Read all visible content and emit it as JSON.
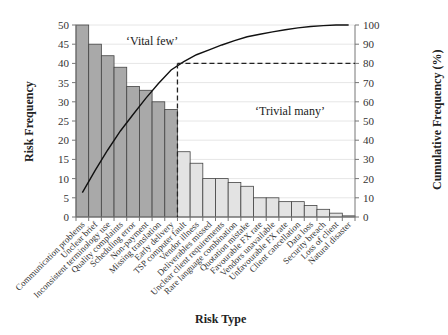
{
  "chart_data": {
    "type": "bar",
    "title": "",
    "xlabel": "Risk Type",
    "ylabel": "Risk Frequency",
    "y2label": "Cumulative Frequency (%)",
    "ylim": [
      0,
      50
    ],
    "y2lim": [
      0,
      100
    ],
    "yticks": [
      0,
      5,
      10,
      15,
      20,
      25,
      30,
      35,
      40,
      45,
      50
    ],
    "y2ticks": [
      0,
      10,
      20,
      30,
      40,
      50,
      60,
      70,
      80,
      90,
      100
    ],
    "grid": true,
    "categories": [
      "Communication problems",
      "Unclear brief",
      "Inconsistent terminology use",
      "Quality complaints",
      "Scheduling error",
      "Non-payment",
      "Missing translation",
      "Early delivery",
      "TSP computer fault",
      "Vendor illness",
      "Deliverables missed",
      "Unclear client requirements",
      "Rare language combination",
      "Quotation mistake",
      "Favourable FX rate",
      "Vendors unavailable",
      "Unfavourable FX rate",
      "Client cancellation",
      "Data loss",
      "Security breach",
      "Loss of client",
      "Natural disaster"
    ],
    "series": [
      {
        "name": "Risk Frequency",
        "type": "bar",
        "axis": "left",
        "values": [
          50,
          45,
          42,
          39,
          34,
          33,
          30,
          28,
          17,
          14,
          10,
          10,
          9,
          8,
          5,
          5,
          4,
          4,
          3,
          2,
          1,
          0.3
        ]
      },
      {
        "name": "Cumulative Frequency (%)",
        "type": "line",
        "axis": "right",
        "values": [
          12.7,
          24.2,
          34.9,
          44.8,
          53.4,
          61.8,
          69.5,
          76.6,
          80.9,
          84.5,
          87.0,
          89.6,
          91.9,
          93.9,
          95.2,
          96.4,
          97.5,
          98.5,
          99.2,
          99.7,
          100.0,
          100.0
        ]
      }
    ],
    "annotations": [
      {
        "text": "‘Vital few’",
        "region": "bars 1-8",
        "color": "#a8a8a8"
      },
      {
        "text": "‘Trivial many’",
        "region": "bars 9-22",
        "color": "#e2e2e2"
      },
      {
        "text": "80% cutoff",
        "type": "dashed-line",
        "y2": 80,
        "x_after_bar": 8
      }
    ],
    "colors": {
      "vital": "#a9a9a9",
      "trivial": "#e3e3e3",
      "line": "#111111",
      "grid": "#e6e6e6"
    }
  }
}
